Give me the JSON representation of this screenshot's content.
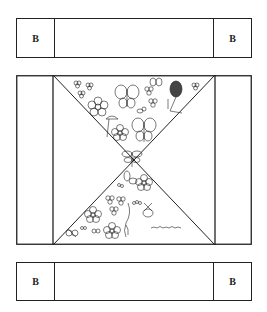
{
  "top_band": {
    "left_label": "B",
    "right_label": "B"
  },
  "bottom_band": {
    "left_label": "B",
    "right_label": "B"
  },
  "middle_panel": {
    "description": "Hourglass of two triangles decorated with flowers and butterflies",
    "line_color": "#222222"
  }
}
